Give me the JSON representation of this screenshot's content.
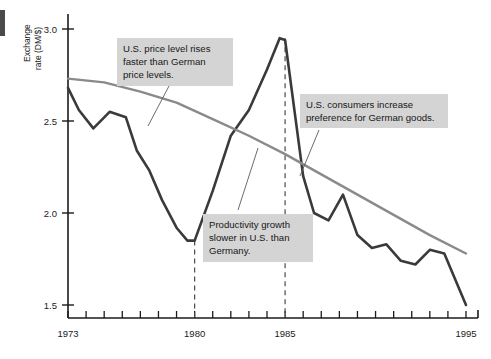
{
  "chart_data": {
    "type": "line",
    "title": "",
    "xlabel": "",
    "ylabel": "Exchange rate (DM/$)",
    "ylabel_line1": "Exchange",
    "ylabel_line2": "rate (DM/$)",
    "xlim": [
      1973,
      1995
    ],
    "ylim": [
      1.4,
      3.05
    ],
    "yticks": [
      1.5,
      2.0,
      2.5,
      3.0
    ],
    "ytick_labels": [
      "1.5",
      "2.0",
      "2.5",
      "3.0"
    ],
    "xticks": [
      1973,
      1974,
      1975,
      1976,
      1977,
      1978,
      1979,
      1980,
      1981,
      1982,
      1983,
      1984,
      1985,
      1986,
      1987,
      1988,
      1989,
      1990,
      1991,
      1992,
      1993,
      1994,
      1995
    ],
    "xtick_labels_shown": [
      "1973",
      "1980",
      "1985",
      "1995"
    ],
    "xtick_label_years": [
      1973,
      1980,
      1985,
      1995
    ],
    "grid": false,
    "legend": "none",
    "reference_lines": [
      {
        "name": "dashed-1980",
        "x": 1980,
        "style": "dashed",
        "y_top": 1.85
      },
      {
        "name": "dashed-1985",
        "x": 1985,
        "style": "dashed",
        "y_top": 2.95
      }
    ],
    "series": [
      {
        "name": "Actual exchange rate",
        "color": "#3a3a3a",
        "width": 2.6,
        "x": [
          1973,
          1973.6,
          1974.4,
          1975.3,
          1976.2,
          1976.8,
          1977.5,
          1978.2,
          1979.0,
          1979.6,
          1980.0,
          1981.0,
          1982.0,
          1983.0,
          1984.0,
          1984.7,
          1985.0,
          1986.0,
          1986.6,
          1987.4,
          1988.2,
          1989.0,
          1989.8,
          1990.6,
          1991.4,
          1992.2,
          1993.0,
          1993.8,
          1995.0
        ],
        "y": [
          2.68,
          2.56,
          2.46,
          2.55,
          2.52,
          2.34,
          2.23,
          2.07,
          1.92,
          1.85,
          1.85,
          2.12,
          2.42,
          2.56,
          2.78,
          2.95,
          2.94,
          2.2,
          2.0,
          1.96,
          2.1,
          1.88,
          1.81,
          1.83,
          1.74,
          1.72,
          1.8,
          1.78,
          1.5
        ]
      },
      {
        "name": "Purchasing power parity trend",
        "color": "#8a8a8a",
        "width": 2.4,
        "x": [
          1973,
          1975,
          1977,
          1979,
          1981,
          1983,
          1985,
          1987,
          1989,
          1991,
          1993,
          1995
        ],
        "y": [
          2.73,
          2.71,
          2.66,
          2.6,
          2.51,
          2.42,
          2.32,
          2.21,
          2.1,
          1.99,
          1.88,
          1.78
        ]
      }
    ],
    "annotations": [
      {
        "id": "annotation-price-level",
        "text": "U.S. price level rises\nfaster than German\nprice levels.",
        "leader_from": [
          169,
          86
        ],
        "leader_to": [
          148,
          126
        ]
      },
      {
        "id": "annotation-consumers",
        "text": "U.S. consumers increase\npreference for German goods.",
        "leader_from": [
          319,
          130
        ],
        "leader_to": [
          300,
          176
        ]
      },
      {
        "id": "annotation-productivity",
        "text": "Productivity growth\nslower in U.S. than\nGermany.",
        "leader_from": [
          238,
          210
        ],
        "leader_to": [
          258,
          148
        ]
      }
    ]
  }
}
